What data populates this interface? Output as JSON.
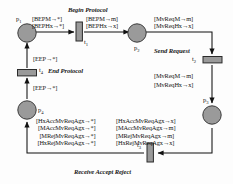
{
  "diagram": {
    "title_caption_top": "Begin Protocol",
    "caption_send": "Send Request",
    "caption_end": "End Protocol",
    "caption_receive": "Receive Accept Reject",
    "colors": {
      "place_fill": "#9a9a9a",
      "place_stroke": "#3a3a3a",
      "transition_fill": "#9a9a9a",
      "transition_stroke": "#2b2b2b",
      "arc": "#1a1a1a",
      "background": "#fdfdfd"
    },
    "places": [
      {
        "id": "p1",
        "label": "p",
        "sub": "1"
      },
      {
        "id": "p2",
        "label": "p",
        "sub": "2"
      },
      {
        "id": "p3",
        "label": "p",
        "sub": "3"
      },
      {
        "id": "p4",
        "label": "p",
        "sub": "4"
      }
    ],
    "transitions": [
      {
        "id": "t1",
        "label": "t",
        "sub": "1"
      },
      {
        "id": "t2",
        "label": "t",
        "sub": "2"
      },
      {
        "id": "t3",
        "label": "t",
        "sub": "3"
      },
      {
        "id": "t4",
        "label": "t",
        "sub": "4"
      }
    ],
    "arc_labels": {
      "p1_to_t1": [
        "[BEPM→*]",
        "[BEPHx→*]"
      ],
      "t1_to_p2": [
        "[BEPM→m]",
        "[BEPHx→x]"
      ],
      "p2_to_t2": [
        "[MvReqM→m]",
        "[MvReqHx→x]"
      ],
      "t2_to_p3": [
        "[MvReqM→m]",
        "[MvReqHx→x]"
      ],
      "t4_to_p1": [
        "[EEP→*]"
      ],
      "p4_to_t4": [
        "[EEP→*]"
      ],
      "t3_to_p4": [
        "[HxAccMvReqAgx→*]",
        "[MAccMvReqAgx→*]",
        "[MRejMvReqAgx→*]",
        "[HxRejMvReqAgx→*]"
      ],
      "p3_to_t3": [
        "[HxAccMvReqAgx→x]",
        "[MAccMvReqAgx→m]",
        "[MRejMvReqAgx→m]",
        "[HxRejMvReqAgx→x]"
      ]
    }
  }
}
